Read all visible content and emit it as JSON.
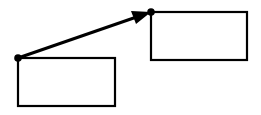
{
  "diagram": {
    "stroke_color": "#000000",
    "background": "#ffffff",
    "shapes": [
      {
        "id": "rect-source",
        "type": "rectangle",
        "x": 18,
        "y": 58,
        "width": 97,
        "height": 48
      },
      {
        "id": "rect-target",
        "type": "rectangle",
        "x": 151,
        "y": 12,
        "width": 96,
        "height": 48
      }
    ],
    "connectors": [
      {
        "id": "arrow-1",
        "from": "rect-source",
        "to": "rect-target",
        "start": [
          18,
          58
        ],
        "end": [
          151,
          12
        ],
        "start_marker": "dot",
        "end_marker": "arrowhead+dot"
      }
    ]
  }
}
